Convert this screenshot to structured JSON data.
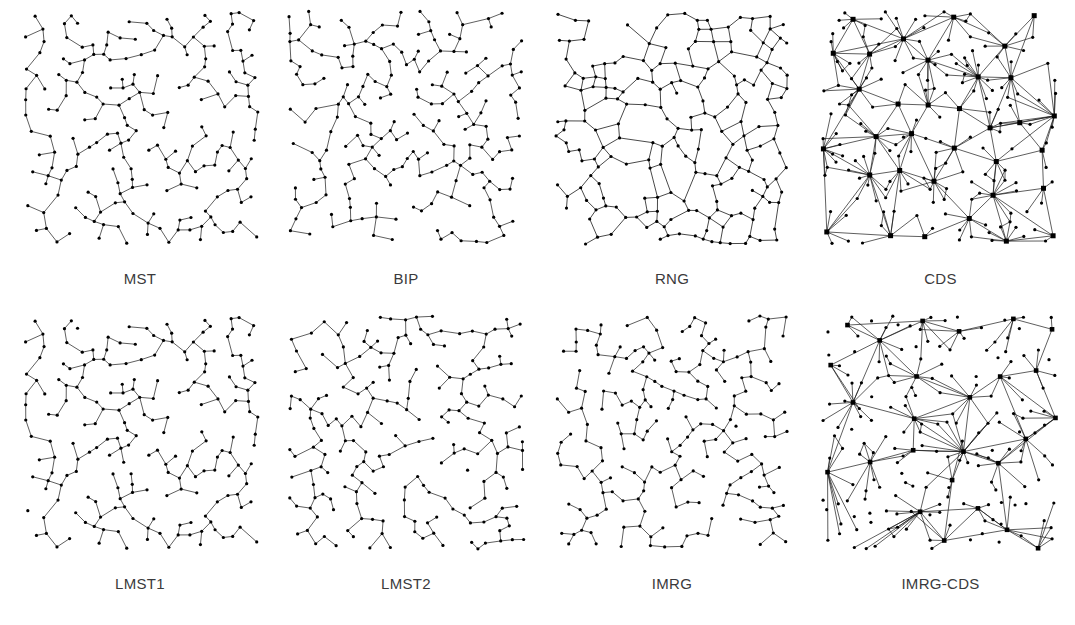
{
  "figure": {
    "rows": 2,
    "cols": 4,
    "background_color": "#ffffff",
    "edge_color": "#1a1a1a",
    "node_color": "#000000",
    "label_color": "#3a3a3c"
  },
  "panels": [
    {
      "id": "mst",
      "label": "MST",
      "topology": "tree",
      "description": "Minimum Spanning Tree: sparse acyclic tree, all nodes small dots, degree mostly 1-3",
      "node_count": 200,
      "node_style": "dot",
      "node_radius": 1.6,
      "hub_count": 0,
      "edge_width": 0.7,
      "seed": 11,
      "mean_degree": 1.99
    },
    {
      "id": "bip",
      "label": "BIP",
      "topology": "tree",
      "description": "Broadcast Incremental Power tree, similar to MST with slightly higher branching",
      "node_count": 200,
      "node_style": "dot",
      "node_radius": 1.6,
      "hub_count": 0,
      "edge_width": 0.7,
      "seed": 23,
      "mean_degree": 1.99
    },
    {
      "id": "rng",
      "label": "RNG",
      "topology": "planar-mesh",
      "description": "Relative Neighborhood Graph: planar mesh with many cycles and polygonal faces",
      "node_count": 200,
      "node_style": "dot",
      "node_radius": 1.6,
      "hub_count": 0,
      "edge_width": 0.8,
      "seed": 37,
      "mean_degree": 2.6
    },
    {
      "id": "cds",
      "label": "CDS",
      "topology": "hub-spoke",
      "description": "Connected Dominating Set: dense hub-and-spoke with large square dominator nodes and long edges",
      "node_count": 200,
      "node_style": "square-hubs",
      "node_radius": 1.6,
      "hub_count": 34,
      "hub_size": 5.0,
      "edge_width": 0.7,
      "seed": 53,
      "mean_degree": 5.4
    },
    {
      "id": "lmst1",
      "label": "LMST1",
      "topology": "tree",
      "description": "Localized Minimum Spanning Tree variant 1, near-identical to MST",
      "node_count": 200,
      "node_style": "dot",
      "node_radius": 1.6,
      "hub_count": 0,
      "edge_width": 0.7,
      "seed": 11,
      "mean_degree": 2.0
    },
    {
      "id": "lmst2",
      "label": "LMST2",
      "topology": "tree",
      "description": "Localized Minimum Spanning Tree variant 2",
      "node_count": 200,
      "node_style": "dot",
      "node_radius": 1.6,
      "hub_count": 0,
      "edge_width": 0.7,
      "seed": 67,
      "mean_degree": 2.0
    },
    {
      "id": "imrg",
      "label": "IMRG",
      "topology": "tree",
      "description": "Incremental Minimum Radius Graph, sparse tree-like topology",
      "node_count": 200,
      "node_style": "dot",
      "node_radius": 1.6,
      "hub_count": 0,
      "edge_width": 0.7,
      "seed": 83,
      "mean_degree": 1.98
    },
    {
      "id": "imrg-cds",
      "label": "IMRG-CDS",
      "topology": "hub-spoke",
      "description": "IMRG combined with CDS: hub-and-spoke but sparser than plain CDS",
      "node_count": 200,
      "node_style": "square-hubs",
      "node_radius": 1.6,
      "hub_count": 26,
      "hub_size": 4.6,
      "edge_width": 0.7,
      "seed": 97,
      "mean_degree": 3.6
    }
  ],
  "chart_data": {
    "type": "scatter",
    "xlabel": "",
    "ylabel": "",
    "grid": false,
    "legend": "none",
    "xlim": [
      0,
      1
    ],
    "ylim": [
      0,
      1
    ],
    "series": [
      {
        "name": "MST",
        "node_count": 200,
        "mean_degree": 1.99,
        "style": "tree"
      },
      {
        "name": "BIP",
        "node_count": 200,
        "mean_degree": 1.99,
        "style": "tree"
      },
      {
        "name": "RNG",
        "node_count": 200,
        "mean_degree": 2.6,
        "style": "planar-mesh"
      },
      {
        "name": "CDS",
        "node_count": 200,
        "mean_degree": 5.4,
        "style": "hub-spoke"
      },
      {
        "name": "LMST1",
        "node_count": 200,
        "mean_degree": 2.0,
        "style": "tree"
      },
      {
        "name": "LMST2",
        "node_count": 200,
        "mean_degree": 2.0,
        "style": "tree"
      },
      {
        "name": "IMRG",
        "node_count": 200,
        "mean_degree": 1.98,
        "style": "tree"
      },
      {
        "name": "IMRG-CDS",
        "node_count": 200,
        "mean_degree": 3.6,
        "style": "hub-spoke"
      }
    ]
  }
}
